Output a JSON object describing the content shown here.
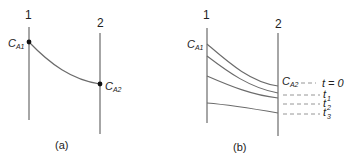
{
  "panels": [
    {
      "id": "a",
      "caption": "(a)",
      "plane_labels": [
        "1",
        "2"
      ],
      "point_labels": {
        "left": {
          "main": "C",
          "sub": "A1"
        },
        "right": {
          "main": "C",
          "sub": "A2"
        }
      }
    },
    {
      "id": "b",
      "caption": "(b)",
      "plane_labels": [
        "1",
        "2"
      ],
      "left_label": {
        "main": "C",
        "sub": "A1"
      },
      "right_label": {
        "main": "C",
        "sub": "A2"
      },
      "time_labels": [
        {
          "main": "t = 0",
          "sub": ""
        },
        {
          "main": "t",
          "sub": "1"
        },
        {
          "main": "t",
          "sub": "2"
        },
        {
          "main": "t",
          "sub": "3"
        }
      ]
    }
  ],
  "colors": {
    "line": "#6b6b6b",
    "dashed": "#8a8a8a",
    "point": "#111111",
    "text": "#222222"
  }
}
